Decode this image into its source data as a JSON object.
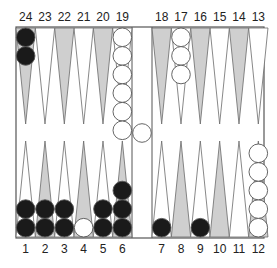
{
  "board": {
    "colors": {
      "background": "#ffffff",
      "frame": "#555555",
      "shaded_point": "#cfcfcf",
      "light_point": "#ffffff",
      "point_outline": "#6a6a6a",
      "black_checker": "#1a1a1a",
      "white_checker": "#ffffff",
      "checker_outline": "#555555"
    },
    "top_labels": [
      "24",
      "23",
      "22",
      "21",
      "20",
      "19",
      "18",
      "17",
      "16",
      "15",
      "14",
      "13"
    ],
    "bottom_labels": [
      "1",
      "2",
      "3",
      "4",
      "5",
      "6",
      "7",
      "8",
      "9",
      "10",
      "11",
      "12"
    ],
    "points": [
      {
        "point": 1,
        "shaded": false,
        "color": "black",
        "count": 2
      },
      {
        "point": 2,
        "shaded": true,
        "color": "black",
        "count": 2
      },
      {
        "point": 3,
        "shaded": false,
        "color": "black",
        "count": 2
      },
      {
        "point": 4,
        "shaded": true,
        "color": "white",
        "count": 1
      },
      {
        "point": 5,
        "shaded": false,
        "color": "black",
        "count": 2
      },
      {
        "point": 6,
        "shaded": true,
        "color": "black",
        "count": 3
      },
      {
        "point": 7,
        "shaded": false,
        "color": "black",
        "count": 1
      },
      {
        "point": 8,
        "shaded": true,
        "color": null,
        "count": 0
      },
      {
        "point": 9,
        "shaded": false,
        "color": "black",
        "count": 1
      },
      {
        "point": 10,
        "shaded": true,
        "color": null,
        "count": 0
      },
      {
        "point": 11,
        "shaded": false,
        "color": null,
        "count": 0
      },
      {
        "point": 12,
        "shaded": true,
        "color": "white",
        "count": 5
      },
      {
        "point": 13,
        "shaded": false,
        "color": null,
        "count": 0
      },
      {
        "point": 14,
        "shaded": true,
        "color": null,
        "count": 0
      },
      {
        "point": 15,
        "shaded": false,
        "color": null,
        "count": 0
      },
      {
        "point": 16,
        "shaded": true,
        "color": null,
        "count": 0
      },
      {
        "point": 17,
        "shaded": false,
        "color": "white",
        "count": 3
      },
      {
        "point": 18,
        "shaded": true,
        "color": null,
        "count": 0
      },
      {
        "point": 19,
        "shaded": false,
        "color": "white",
        "count": 6
      },
      {
        "point": 20,
        "shaded": true,
        "color": null,
        "count": 0
      },
      {
        "point": 21,
        "shaded": false,
        "color": null,
        "count": 0
      },
      {
        "point": 22,
        "shaded": true,
        "color": null,
        "count": 0
      },
      {
        "point": 23,
        "shaded": false,
        "color": null,
        "count": 0
      },
      {
        "point": 24,
        "shaded": true,
        "color": "black",
        "count": 2
      }
    ],
    "bar": [
      {
        "color": "white",
        "count": 1
      }
    ]
  }
}
